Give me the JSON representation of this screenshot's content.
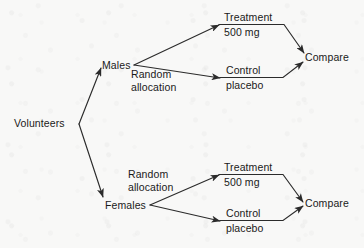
{
  "diagram": {
    "type": "flow-diagram",
    "colors": {
      "background": "#f8f8f7",
      "ink": "#1a1a1a",
      "line": "#2b2b2b"
    },
    "source": {
      "label": "Volunteers"
    },
    "strata": [
      {
        "id": "males",
        "label": "Males",
        "allocation_note_line1": "Random",
        "allocation_note_line2": "allocation",
        "arms": [
          {
            "id": "males-treatment",
            "line1": "Treatment",
            "line2": "500 mg"
          },
          {
            "id": "males-control",
            "line1": "Control",
            "line2": "placebo"
          }
        ],
        "outcome": "Compare"
      },
      {
        "id": "females",
        "label": "Females",
        "allocation_note_line1": "Random",
        "allocation_note_line2": "allocation",
        "arms": [
          {
            "id": "females-treatment",
            "line1": "Treatment",
            "line2": "500 mg"
          },
          {
            "id": "females-control",
            "line1": "Control",
            "line2": "placebo"
          }
        ],
        "outcome": "Compare"
      }
    ]
  }
}
